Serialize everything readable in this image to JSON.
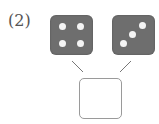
{
  "problem": {
    "label": "(2)",
    "dice": [
      {
        "value": 4,
        "pips": [
          [
            12,
            11
          ],
          [
            30,
            11
          ],
          [
            12,
            28
          ],
          [
            30,
            28
          ]
        ]
      },
      {
        "value": 3,
        "pips": [
          [
            30,
            10
          ],
          [
            20,
            19
          ],
          [
            11,
            28
          ]
        ]
      }
    ],
    "answer_box": {
      "value": ""
    }
  },
  "colors": {
    "die_fill": "#6e6e6e",
    "pip": "#f4f4f4",
    "line": "#777777",
    "box_border": "#9a9a9a"
  }
}
